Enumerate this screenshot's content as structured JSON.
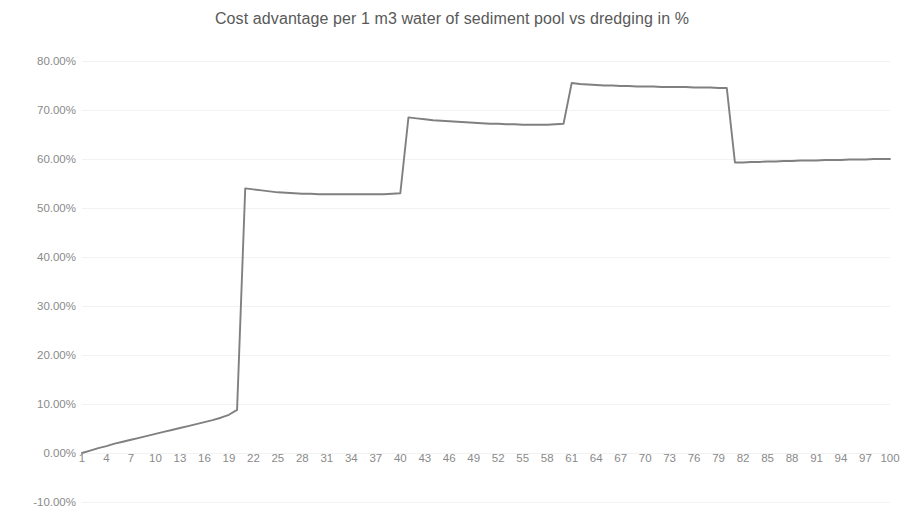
{
  "chart_data": {
    "type": "line",
    "title": "Cost advantage per 1 m3 water of sediment pool vs dredging in %",
    "xlabel": "",
    "ylabel": "",
    "grid": true,
    "legend": false,
    "legend_position": "none",
    "series_color": "#808080",
    "xlim": [
      1,
      100
    ],
    "ylim": [
      -0.1,
      0.8
    ],
    "ytick_labels": [
      "80.00%",
      "70.00%",
      "60.00%",
      "50.00%",
      "40.00%",
      "30.00%",
      "20.00%",
      "10.00%",
      "0.00%",
      "-10.00%"
    ],
    "ytick_values": [
      0.8,
      0.7,
      0.6,
      0.5,
      0.4,
      0.3,
      0.2,
      0.1,
      0.0,
      -0.1
    ],
    "xtick_labels": [
      "1",
      "4",
      "7",
      "10",
      "13",
      "16",
      "19",
      "22",
      "25",
      "28",
      "31",
      "34",
      "37",
      "40",
      "43",
      "46",
      "49",
      "52",
      "55",
      "58",
      "61",
      "64",
      "67",
      "70",
      "73",
      "76",
      "79",
      "82",
      "85",
      "88",
      "91",
      "94",
      "97",
      "100"
    ],
    "xtick_values": [
      1,
      4,
      7,
      10,
      13,
      16,
      19,
      22,
      25,
      28,
      31,
      34,
      37,
      40,
      43,
      46,
      49,
      52,
      55,
      58,
      61,
      64,
      67,
      70,
      73,
      76,
      79,
      82,
      85,
      88,
      91,
      94,
      97,
      100
    ],
    "x": [
      1,
      2,
      3,
      4,
      5,
      6,
      7,
      8,
      9,
      10,
      11,
      12,
      13,
      14,
      15,
      16,
      17,
      18,
      19,
      20,
      21,
      22,
      23,
      24,
      25,
      26,
      27,
      28,
      29,
      30,
      31,
      32,
      33,
      34,
      35,
      36,
      37,
      38,
      39,
      40,
      41,
      42,
      43,
      44,
      45,
      46,
      47,
      48,
      49,
      50,
      51,
      52,
      53,
      54,
      55,
      56,
      57,
      58,
      59,
      60,
      61,
      62,
      63,
      64,
      65,
      66,
      67,
      68,
      69,
      70,
      71,
      72,
      73,
      74,
      75,
      76,
      77,
      78,
      79,
      80,
      81,
      82,
      83,
      84,
      85,
      86,
      87,
      88,
      89,
      90,
      91,
      92,
      93,
      94,
      95,
      96,
      97,
      98,
      99,
      100
    ],
    "values": [
      0.0,
      0.005,
      0.01,
      0.014,
      0.019,
      0.023,
      0.027,
      0.031,
      0.035,
      0.039,
      0.043,
      0.047,
      0.051,
      0.055,
      0.059,
      0.063,
      0.067,
      0.072,
      0.078,
      0.088,
      0.54,
      0.538,
      0.536,
      0.534,
      0.532,
      0.531,
      0.53,
      0.529,
      0.529,
      0.528,
      0.528,
      0.528,
      0.528,
      0.528,
      0.528,
      0.528,
      0.528,
      0.528,
      0.529,
      0.53,
      0.685,
      0.683,
      0.681,
      0.679,
      0.678,
      0.677,
      0.676,
      0.675,
      0.674,
      0.673,
      0.672,
      0.672,
      0.671,
      0.671,
      0.67,
      0.67,
      0.67,
      0.67,
      0.671,
      0.672,
      0.755,
      0.753,
      0.752,
      0.751,
      0.75,
      0.75,
      0.749,
      0.749,
      0.748,
      0.748,
      0.748,
      0.747,
      0.747,
      0.747,
      0.747,
      0.746,
      0.746,
      0.746,
      0.745,
      0.745,
      0.593,
      0.593,
      0.594,
      0.594,
      0.595,
      0.595,
      0.596,
      0.596,
      0.597,
      0.597,
      0.597,
      0.598,
      0.598,
      0.598,
      0.599,
      0.599,
      0.599,
      0.6,
      0.6,
      0.6
    ],
    "annotations": []
  }
}
